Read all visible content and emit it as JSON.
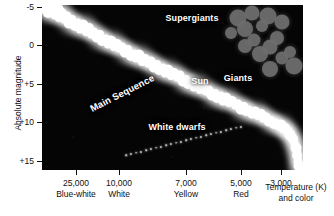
{
  "figure": {
    "type": "hertzsprung-russell-diagram",
    "background": "#ffffff",
    "plot_background": "#050505"
  },
  "axes": {
    "y": {
      "label": "Absolute magnitude",
      "ticks": [
        "-5",
        "0",
        "+5",
        "+10",
        "+15"
      ],
      "tick_values": [
        -5,
        0,
        5,
        10,
        15
      ],
      "direction": "inverted"
    },
    "x": {
      "label_line1": "Temperature (K)",
      "label_line2": "and color",
      "ticks": [
        "25,000",
        "10,000",
        "7,000",
        "5,000",
        "3,000"
      ],
      "tick_values": [
        25000,
        10000,
        7000,
        5000,
        3000
      ],
      "color_names": [
        "Blue-white",
        "White",
        "Yellow",
        "Red",
        ""
      ],
      "direction": "inverted"
    }
  },
  "annotations": {
    "supergiants": "Supergiants",
    "giants": "Giants",
    "sun": "Sun",
    "main_sequence": "Main Sequence",
    "white_dwarfs": "White dwarfs"
  },
  "chart_data": {
    "type": "scatter",
    "title": "",
    "xlabel": "Temperature (K) and color",
    "ylabel": "Absolute magnitude",
    "xlim": [
      30000,
      2500
    ],
    "ylim": [
      -5,
      15
    ],
    "x_log": true,
    "grid": false,
    "legend": "none",
    "xticks": [
      25000,
      10000,
      7000,
      5000,
      3000
    ],
    "xticklabels": [
      "25,000",
      "10,000",
      "7,000",
      "5,000",
      "3,000"
    ],
    "xtick_colors": [
      "Blue-white",
      "White",
      "Yellow",
      "Red",
      ""
    ],
    "yticks": [
      -5,
      0,
      5,
      10,
      15
    ],
    "yticklabels": [
      "-5",
      "0",
      "+5",
      "+10",
      "+15"
    ],
    "series": [
      {
        "name": "Main Sequence",
        "color": "#ffffff",
        "marker_size": "large-glow",
        "points": [
          [
            0.5,
            1.0
          ],
          [
            2.5,
            0.6
          ],
          [
            4.0,
            3.5
          ],
          [
            7.5,
            2.0
          ],
          [
            6.0,
            7.5
          ],
          [
            10.5,
            5.5
          ],
          [
            12.5,
            9.5
          ],
          [
            15.5,
            3.5
          ],
          [
            17.0,
            12.5
          ],
          [
            20.0,
            7.5
          ],
          [
            22.0,
            15.0
          ],
          [
            24.5,
            11.0
          ],
          [
            27.0,
            18.0
          ],
          [
            30.0,
            14.0
          ],
          [
            32.5,
            20.5
          ],
          [
            35.5,
            17.0
          ],
          [
            38.0,
            23.5
          ],
          [
            41.0,
            20.0
          ],
          [
            43.5,
            27.0
          ],
          [
            46.5,
            23.0
          ],
          [
            49.0,
            29.5
          ],
          [
            52.0,
            26.5
          ],
          [
            54.5,
            32.0
          ],
          [
            57.5,
            29.0
          ],
          [
            60.0,
            35.5
          ],
          [
            63.5,
            32.5
          ],
          [
            66.0,
            38.5
          ],
          [
            69.0,
            35.5
          ],
          [
            71.5,
            41.5
          ],
          [
            74.5,
            38.5
          ],
          [
            77.0,
            44.0
          ],
          [
            80.0,
            41.5
          ],
          [
            83.0,
            47.0
          ],
          [
            86.0,
            44.0
          ],
          [
            88.5,
            50.5
          ],
          [
            91.5,
            47.5
          ],
          [
            94.0,
            53.0
          ],
          [
            97.0,
            50.0
          ],
          [
            100.0,
            56.5
          ],
          [
            103.0,
            53.5
          ],
          [
            106.0,
            59.0
          ],
          [
            109.0,
            56.0
          ],
          [
            111.5,
            62.0
          ],
          [
            114.5,
            59.0
          ],
          [
            117.0,
            65.0
          ],
          [
            120.5,
            62.0
          ],
          [
            123.0,
            67.5
          ],
          [
            126.0,
            64.5
          ],
          [
            129.0,
            70.5
          ],
          [
            132.0,
            67.5
          ],
          [
            135.0,
            73.0
          ],
          [
            138.0,
            70.0
          ],
          [
            140.5,
            76.0
          ],
          [
            143.5,
            73.5
          ],
          [
            146.0,
            79.0
          ],
          [
            149.5,
            76.0
          ],
          [
            152.0,
            81.5
          ],
          [
            155.0,
            79.0
          ],
          [
            158.0,
            84.5
          ],
          [
            161.0,
            81.5
          ],
          [
            164.0,
            87.0
          ],
          [
            167.0,
            84.5
          ],
          [
            169.5,
            90.0
          ],
          [
            172.5,
            87.5
          ],
          [
            175.0,
            92.5
          ],
          [
            178.5,
            90.0
          ],
          [
            181.0,
            95.5
          ],
          [
            184.0,
            93.0
          ],
          [
            187.0,
            98.0
          ],
          [
            190.0,
            95.5
          ],
          [
            193.0,
            100.5
          ],
          [
            196.0,
            98.5
          ],
          [
            198.5,
            103.5
          ],
          [
            201.5,
            101.0
          ],
          [
            204.0,
            106.0
          ],
          [
            207.0,
            104.0
          ],
          [
            210.0,
            108.5
          ],
          [
            213.0,
            106.5
          ],
          [
            215.5,
            111.0
          ],
          [
            218.5,
            109.0
          ],
          [
            221.0,
            113.5
          ],
          [
            224.0,
            112.0
          ],
          [
            226.5,
            116.0
          ],
          [
            229.0,
            114.5
          ],
          [
            231.5,
            118.5
          ],
          [
            234.0,
            117.0
          ],
          [
            236.5,
            121.0
          ],
          [
            238.5,
            120.0
          ],
          [
            240.5,
            123.5
          ],
          [
            242.5,
            122.5
          ],
          [
            244.5,
            126.5
          ],
          [
            246.0,
            126.0
          ],
          [
            247.5,
            129.5
          ],
          [
            249.0,
            130.0
          ],
          [
            250.5,
            133.5
          ],
          [
            251.5,
            136.0
          ],
          [
            252.5,
            139.5
          ],
          [
            253.5,
            143.0
          ],
          [
            254.5,
            146.5
          ],
          [
            255.0,
            150.0
          ],
          [
            255.5,
            153.5
          ],
          [
            256.0,
            157.0
          ],
          [
            256.5,
            160.5
          ],
          [
            257.0,
            164.0
          ]
        ]
      },
      {
        "name": "Giants",
        "color": "#6e6e6e",
        "marker_size": "very-large",
        "points": [
          [
            189.0,
            28.0
          ],
          [
            196.0,
            12.5
          ],
          [
            203.0,
            24.0
          ],
          [
            210.0,
            8.0
          ],
          [
            203.0,
            41.0
          ],
          [
            212.0,
            34.5
          ],
          [
            220.0,
            21.0
          ],
          [
            226.0,
            11.0
          ],
          [
            218.0,
            48.5
          ],
          [
            228.0,
            42.0
          ],
          [
            235.0,
            33.0
          ],
          [
            240.0,
            52.5
          ],
          [
            248.0,
            46.5
          ],
          [
            252.0,
            61.0
          ],
          [
            228.0,
            63.5
          ],
          [
            240.0,
            17.0
          ]
        ]
      },
      {
        "name": "White dwarfs",
        "color": "#d8d8d8",
        "marker_size": "tiny",
        "points": [
          [
            84.0,
            150.0
          ],
          [
            89.0,
            149.0
          ],
          [
            94.0,
            147.5
          ],
          [
            99.0,
            146.5
          ],
          [
            104.0,
            145.0
          ],
          [
            109.0,
            144.0
          ],
          [
            114.0,
            142.5
          ],
          [
            119.0,
            141.5
          ],
          [
            124.0,
            140.0
          ],
          [
            129.0,
            139.0
          ],
          [
            134.0,
            137.5
          ],
          [
            139.0,
            136.5
          ],
          [
            144.0,
            135.0
          ],
          [
            149.0,
            134.0
          ],
          [
            154.0,
            132.5
          ],
          [
            159.0,
            131.5
          ],
          [
            164.0,
            130.0
          ],
          [
            169.0,
            129.0
          ],
          [
            174.0,
            127.5
          ],
          [
            179.0,
            126.5
          ],
          [
            184.0,
            125.0
          ],
          [
            189.0,
            124.0
          ],
          [
            194.0,
            122.5
          ],
          [
            199.0,
            121.5
          ]
        ]
      }
    ],
    "annotations": [
      {
        "text": "Supergiants",
        "x": 150,
        "y": 13
      },
      {
        "text": "Giants",
        "x": 196,
        "y": 73
      },
      {
        "text": "Sun",
        "x": 158,
        "y": 76
      },
      {
        "text": "Main Sequence",
        "x": 80,
        "y": 88,
        "rotation": -27
      },
      {
        "text": "White dwarfs",
        "x": 135,
        "y": 122
      }
    ]
  }
}
